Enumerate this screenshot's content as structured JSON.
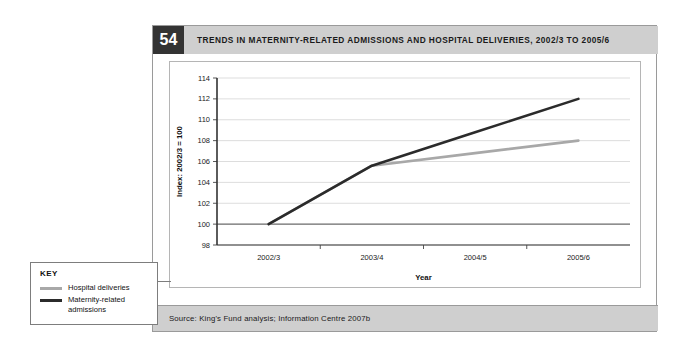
{
  "figure": {
    "number": "54",
    "title": "TRENDS IN MATERNITY-RELATED ADMISSIONS AND HOSPITAL DELIVERIES, 2002/3 TO 2005/6",
    "source": "Source: King's Fund analysis; Information Centre 2007b"
  },
  "key": {
    "heading": "KEY",
    "items": [
      {
        "label": "Hospital deliveries",
        "color": "#a8a8a8"
      },
      {
        "label": "Maternity-related admissions",
        "color": "#2b2b2b"
      }
    ]
  },
  "chart_data": {
    "type": "line",
    "title": "TRENDS IN MATERNITY-RELATED ADMISSIONS AND HOSPITAL DELIVERIES, 2002/3 TO 2005/6",
    "xlabel": "Year",
    "ylabel": "Index: 2002/3 = 100",
    "categories": [
      "2002/3",
      "2003/4",
      "2004/5",
      "2005/6"
    ],
    "ylim": [
      98,
      114
    ],
    "yticks": [
      98,
      100,
      102,
      104,
      106,
      108,
      110,
      112,
      114
    ],
    "grid": true,
    "legend_position": "external-left",
    "baseline": 100,
    "series": [
      {
        "name": "Maternity-related admissions",
        "color": "#2b2b2b",
        "width": 2.6,
        "values": [
          100,
          105.6,
          108.8,
          112
        ]
      },
      {
        "name": "Hospital deliveries",
        "color": "#a8a8a8",
        "width": 2.6,
        "values": [
          100,
          105.6,
          106.8,
          108
        ]
      }
    ]
  }
}
